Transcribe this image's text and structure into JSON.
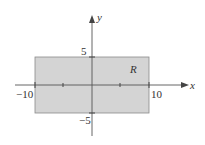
{
  "figure": {
    "region": {
      "label": "R",
      "x_range": [
        -10,
        10
      ],
      "y_range": [
        -5,
        5
      ],
      "fill_color": "#d4d4d4",
      "stroke_color": "#8a8a8a"
    },
    "axes": {
      "x_label": "x",
      "y_label": "y",
      "axis_color": "#555555",
      "x_ticks": [
        -10,
        -5,
        5,
        10
      ],
      "y_ticks": [
        -5,
        5
      ]
    },
    "tick_labels": {
      "x_neg": "−10",
      "x_pos": "10",
      "y_pos": "5",
      "y_neg": "−5"
    }
  }
}
